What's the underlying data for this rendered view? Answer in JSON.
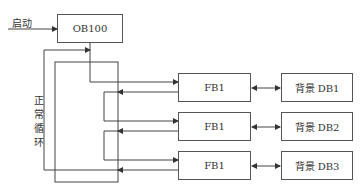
{
  "diagram": {
    "start_label": "启动",
    "loop_label": [
      "正",
      "常",
      "循",
      "环"
    ],
    "ob_box": "OB100",
    "fb_boxes": [
      "FB1",
      "FB1",
      "FB1"
    ],
    "db_boxes": [
      "背景 DB1",
      "背景 DB2",
      "背景 DB3"
    ]
  }
}
